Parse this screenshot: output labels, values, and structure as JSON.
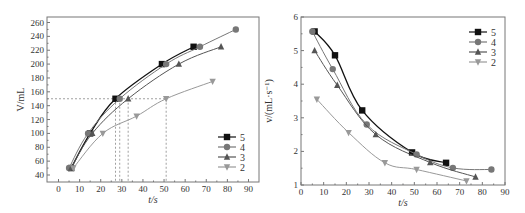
{
  "chart_data": [
    {
      "type": "line",
      "title": "",
      "xlabel": "t/s",
      "ylabel": "V/mL",
      "xlim": [
        -5,
        95
      ],
      "ylim": [
        30,
        265
      ],
      "xticks": [
        0,
        10,
        20,
        30,
        40,
        50,
        60,
        70,
        80,
        90
      ],
      "yticks": [
        40,
        60,
        80,
        100,
        120,
        140,
        160,
        180,
        200,
        220,
        240,
        260
      ],
      "grid": false,
      "legend_position": "lower right",
      "reference_lines": {
        "horizontal_y": 150,
        "vertical_x": [
          27,
          29,
          33,
          51
        ]
      },
      "series": [
        {
          "name": "5",
          "marker": "square",
          "color": "#111111",
          "x": [
            6,
            15,
            27,
            49,
            64
          ],
          "y": [
            50,
            100,
            150,
            200,
            225
          ]
        },
        {
          "name": "4",
          "marker": "circle",
          "color": "#777777",
          "x": [
            5,
            14,
            29,
            51,
            67,
            84
          ],
          "y": [
            50,
            100,
            150,
            200,
            225,
            250
          ]
        },
        {
          "name": "3",
          "marker": "triangle-up",
          "color": "#555555",
          "x": [
            6,
            16,
            33,
            57,
            77
          ],
          "y": [
            50,
            100,
            150,
            200,
            225
          ]
        },
        {
          "name": "2",
          "marker": "triangle-down",
          "color": "#999999",
          "x": [
            7,
            21,
            37,
            51,
            73
          ],
          "y": [
            50,
            100,
            125,
            150,
            175
          ]
        }
      ]
    },
    {
      "type": "line",
      "title": "",
      "xlabel": "t/s",
      "ylabel": "v/(mL·s⁻¹)",
      "xlim": [
        0,
        90
      ],
      "ylim": [
        1,
        6
      ],
      "xticks": [
        0,
        10,
        20,
        30,
        40,
        50,
        60,
        70,
        80,
        90
      ],
      "yticks": [
        1,
        2,
        3,
        4,
        5,
        6
      ],
      "grid": false,
      "legend_position": "upper right",
      "series": [
        {
          "name": "5",
          "marker": "square",
          "color": "#111111",
          "x": [
            6,
            15,
            27,
            49,
            64
          ],
          "y": [
            5.57,
            4.86,
            3.22,
            1.97,
            1.66
          ]
        },
        {
          "name": "4",
          "marker": "circle",
          "color": "#777777",
          "x": [
            5,
            14,
            29,
            51,
            67,
            84
          ],
          "y": [
            5.57,
            4.45,
            2.8,
            1.91,
            1.51,
            1.46
          ]
        },
        {
          "name": "3",
          "marker": "triangle-up",
          "color": "#555555",
          "x": [
            6,
            16,
            33,
            57,
            77
          ],
          "y": [
            5.0,
            3.97,
            2.5,
            1.67,
            1.24
          ]
        },
        {
          "name": "2",
          "marker": "triangle-down",
          "color": "#999999",
          "x": [
            7,
            21,
            37,
            51,
            73
          ],
          "y": [
            3.55,
            2.56,
            1.66,
            1.46,
            1.12
          ]
        }
      ]
    }
  ],
  "labels": {
    "left_xlabel": "t/s",
    "left_ylabel": "V/mL",
    "right_xlabel": "t/s",
    "right_ylabel": "v/(mL·s⁻¹)"
  }
}
